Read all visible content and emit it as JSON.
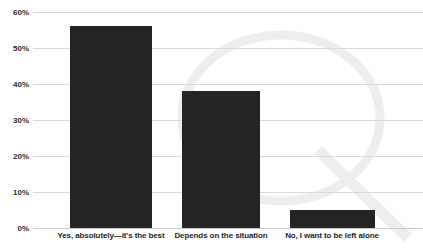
{
  "chart_data": {
    "type": "bar",
    "title": "",
    "xlabel": "",
    "ylabel": "",
    "categories": [
      "Yes, absolutely—it's the best",
      "Depends on the situation",
      "No, I want to be left alone"
    ],
    "values": [
      56,
      38,
      5
    ],
    "value_labels": [
      "56%",
      "38%",
      "5%"
    ],
    "ylim": [
      0,
      60
    ],
    "yticks": [
      0,
      10,
      20,
      30,
      40,
      50,
      60
    ],
    "ytick_labels": [
      "0%",
      "10%",
      "20%",
      "30%",
      "40%",
      "50%",
      "60%"
    ],
    "grid": true,
    "legend": false,
    "legend_position": "none",
    "series": [
      {
        "name": "Share of respondents",
        "values": [
          56,
          38,
          5
        ]
      }
    ]
  },
  "style": {
    "bar_color": "#242424",
    "grid_color": "#d9d9d9",
    "baseline_color": "#c9c9c9",
    "tick_label_color": "#2b2b2b",
    "category_label_color": "#1f1f1f",
    "background": "#ffffff",
    "watermark_color": "#ededed"
  },
  "watermark": {
    "name": "quora-q-logo-watermark",
    "shape": "letter-q-ring"
  }
}
